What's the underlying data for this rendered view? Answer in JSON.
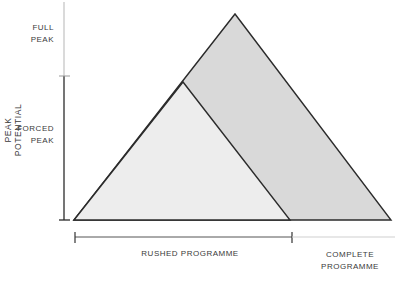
{
  "diagram": {
    "type": "nested-triangles",
    "y_axis_label": "PEAK POTENTIAL",
    "y_levels": [
      {
        "label_line1": "FULL",
        "label_line2": "PEAK"
      },
      {
        "label_line1": "FORCED",
        "label_line2": "PEAK"
      }
    ],
    "x_labels": {
      "rushed": "RUSHED PROGRAMME",
      "complete_line1": "COMPLETE",
      "complete_line2": "PROGRAMME"
    },
    "colors": {
      "outer_fill": "#d9d9d9",
      "inner_fill": "#ededed",
      "stroke": "#2b2b2b",
      "axis_light": "#b0b0b0"
    }
  }
}
